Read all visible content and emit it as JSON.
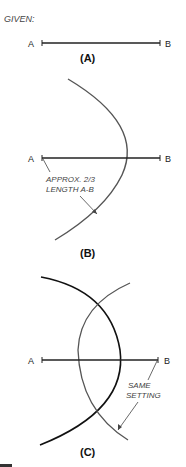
{
  "header": {
    "given_label": "GIVEN:"
  },
  "panels": [
    {
      "caption": "(A)",
      "point_a": "A",
      "point_b": "B"
    },
    {
      "caption": "(B)",
      "point_a": "A",
      "point_b": "B",
      "note_line1": "APPROX. 2/3",
      "note_line2": "LENGTH A-B"
    },
    {
      "caption": "(C)",
      "point_a": "A",
      "point_b": "B",
      "note_line1": "SAME",
      "note_line2": "SETTING"
    }
  ],
  "colors": {
    "line": "#222222",
    "arc_light": "#555555",
    "note": "#444444"
  }
}
